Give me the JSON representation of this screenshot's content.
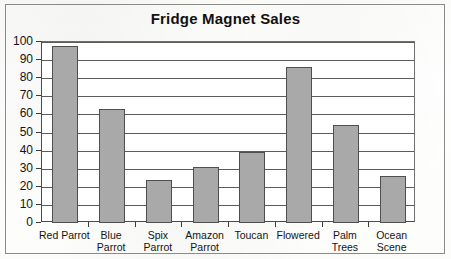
{
  "chart_data": {
    "type": "bar",
    "title": "Fridge Magnet Sales",
    "xlabel": "",
    "ylabel": "",
    "categories": [
      "Red Parrot",
      "Blue Parrot",
      "Spix Parrot",
      "Amazon Parrot",
      "Toucan",
      "Flowered",
      "Palm Trees",
      "Ocean Scene"
    ],
    "values": [
      98,
      63,
      24,
      31,
      39,
      86,
      54,
      26
    ],
    "ylim": [
      0,
      100
    ],
    "ytick_step": 10,
    "ytick_labels": [
      "100",
      "90",
      "80",
      "70",
      "60",
      "50",
      "40",
      "30",
      "20",
      "10",
      "0"
    ],
    "grid": true,
    "legend": false,
    "bar_color": "#a9a9a9",
    "bar_border_color": "#4f4f4f",
    "axis_color": "#3c3c3c",
    "gridline_color": "#5c5c5c",
    "plot_background": "#ffffff",
    "frame_border_color": "#8a8a8a"
  },
  "category_label_lines": [
    [
      "Red Parrot"
    ],
    [
      "Blue",
      "Parrot"
    ],
    [
      "Spix",
      "Parrot"
    ],
    [
      "Amazon",
      "Parrot"
    ],
    [
      "Toucan"
    ],
    [
      "Flowered"
    ],
    [
      "Palm",
      "Trees"
    ],
    [
      "Ocean",
      "Scene"
    ]
  ]
}
